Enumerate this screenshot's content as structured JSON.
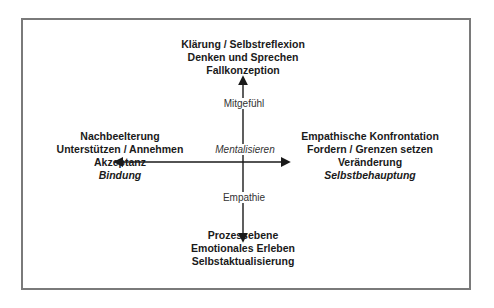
{
  "diagram": {
    "top": [
      "Klärung / Selbstreflexion",
      "Denken und Sprechen",
      "Fallkonzeption"
    ],
    "left": [
      "Nachbeelterung",
      "Unterstützen / Annehmen",
      "Akzeptanz",
      "Bindung"
    ],
    "right": [
      "Empathische Konfrontation",
      "Fordern / Grenzen setzen",
      "Veränderung",
      "Selbstbehauptung"
    ],
    "bottom": [
      "Prozessebene",
      "Emotionales Erleben",
      "Selbstaktualisierung"
    ],
    "axis_labels": {
      "up": "Mitgefühl",
      "center": "Mentalisieren",
      "down": "Empathie"
    },
    "colors": {
      "frame": "#7a7a7a",
      "line": "#1a1a1a",
      "text": "#1a1a1a"
    }
  }
}
